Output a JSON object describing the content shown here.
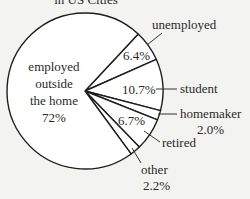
{
  "chart_data": {
    "type": "pie",
    "title": "in US Cities",
    "title_cropped": true,
    "categories": [
      "unemployed",
      "student",
      "homemaker",
      "retired",
      "other",
      "employed outside the home"
    ],
    "values": [
      6.4,
      10.7,
      2.0,
      6.7,
      2.2,
      72
    ],
    "units": "%",
    "labels": {
      "unemployed": "unemployed",
      "unemployed_pct": "6.4%",
      "student": "student",
      "student_pct": "10.7%",
      "homemaker": "homemaker",
      "homemaker_pct": "2.0%",
      "retired": "retired",
      "retired_pct": "6.7%",
      "other": "other",
      "other_pct": "2.2%",
      "employed_line1": "employed",
      "employed_line2": "outside",
      "employed_line3": "the home",
      "employed_pct": "72%"
    },
    "start_angle_deg": 43,
    "direction": "clockwise",
    "legend": "none (callout labels)",
    "colors": {
      "fill": "#ffffff",
      "stroke": "#1e1e1e",
      "background": "#f3f3f1"
    }
  }
}
